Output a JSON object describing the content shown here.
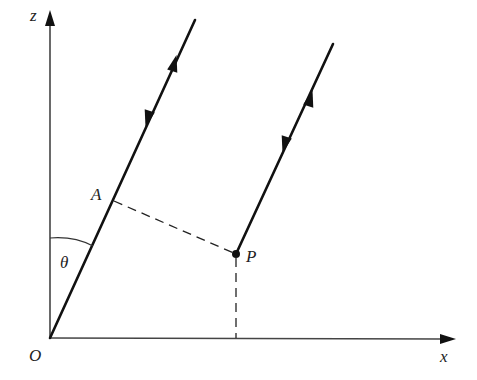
{
  "diagram": {
    "labels": {
      "z_axis": "z",
      "x_axis": "x",
      "origin": "O",
      "point_a": "A",
      "point_p": "P",
      "angle": "θ"
    },
    "colors": {
      "background": "#ffffff",
      "ink": "#111111",
      "axis": "#444444"
    },
    "points": {
      "O": [
        50,
        338
      ],
      "A": [
        114,
        201
      ],
      "P": [
        236,
        254
      ],
      "line1_top": [
        195,
        20
      ],
      "line2_top": [
        333,
        44
      ],
      "z_tip": [
        50,
        12
      ],
      "x_tip": [
        455,
        339
      ]
    }
  }
}
